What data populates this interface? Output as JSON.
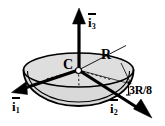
{
  "figure": {
    "background_color": "#ffffff",
    "line_color": "#000000",
    "fill_color": "#d9d9d9",
    "labels": {
      "axis_1": "i",
      "axis_1_sub": "1",
      "axis_2": "i",
      "axis_2_sub": "2",
      "axis_3": "i",
      "axis_3_sub": "3",
      "center": "C",
      "radius": "R",
      "offset": "3R/8"
    },
    "shapes": {
      "hemisphere_center_x": 78.5,
      "hemisphere_center_y": 70,
      "rim_radius_x": 55,
      "rim_radius_y": 17,
      "bowl_depth": 36
    },
    "vectors": [
      {
        "name": "i3",
        "from": [
          78.5,
          70
        ],
        "to": [
          79,
          9
        ],
        "style": "solid-arrow"
      },
      {
        "name": "i1",
        "from": [
          78.5,
          70
        ],
        "to": [
          12,
          93
        ],
        "style": "solid-arrow"
      },
      {
        "name": "i2",
        "from": [
          78.5,
          70
        ],
        "to": [
          151,
          118
        ],
        "style": "solid-arrow"
      }
    ],
    "annotations": [
      {
        "name": "radius-leader",
        "label": "R",
        "from": [
          78.5,
          70
        ],
        "to": [
          124,
          46
        ]
      },
      {
        "name": "offset-caliper",
        "label": "3R/8",
        "from": [
          120,
          78
        ],
        "to": [
          127,
          94
        ]
      }
    ]
  }
}
